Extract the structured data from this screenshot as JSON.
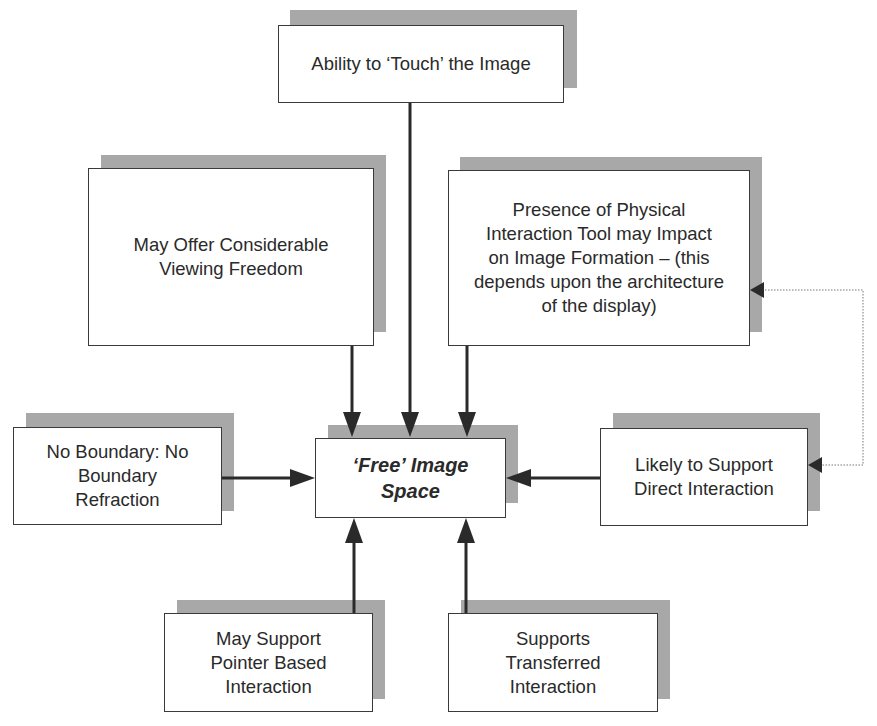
{
  "diagram": {
    "title": "",
    "nodes": {
      "touch": {
        "label": "Ability to ‘Touch’ the Image"
      },
      "viewing": {
        "label": "May Offer Considerable\nViewing Freedom"
      },
      "physical_tool": {
        "label": "Presence of Physical\nInteraction Tool may Impact\non Image Formation – (this\ndepends upon the architecture\nof the display)"
      },
      "no_boundary": {
        "label": "No Boundary: No\nBoundary\nRefraction"
      },
      "center": {
        "label": "‘Free’ Image\nSpace"
      },
      "direct": {
        "label": "Likely to Support\nDirect Interaction"
      },
      "pointer": {
        "label": "May Support\nPointer Based\nInteraction"
      },
      "transferred": {
        "label": "Supports\nTransferred\nInteraction"
      }
    },
    "edges": [
      {
        "from": "touch",
        "to": "center",
        "style": "solid"
      },
      {
        "from": "viewing",
        "to": "center",
        "style": "solid"
      },
      {
        "from": "physical_tool",
        "to": "center",
        "style": "solid"
      },
      {
        "from": "no_boundary",
        "to": "center",
        "style": "solid"
      },
      {
        "from": "direct",
        "to": "center",
        "style": "solid"
      },
      {
        "from": "pointer",
        "to": "center",
        "style": "solid"
      },
      {
        "from": "transferred",
        "to": "center",
        "style": "solid"
      },
      {
        "from": "physical_tool",
        "to": "direct",
        "style": "dotted",
        "bidirectional": true
      }
    ]
  }
}
